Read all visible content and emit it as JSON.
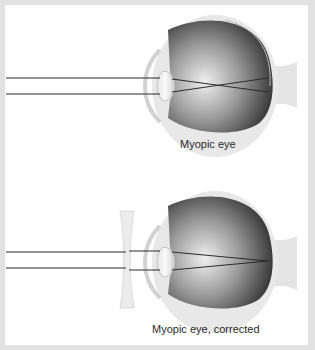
{
  "figure": {
    "panels": [
      {
        "id": "uncorrected",
        "caption": "Myopic eye",
        "corrective_lens": false,
        "focus": "in front of retina"
      },
      {
        "id": "corrected",
        "caption": "Myopic eye, corrected",
        "corrective_lens": true,
        "lens_type": "concave",
        "focus": "on retina"
      }
    ]
  },
  "colors": {
    "background_frame": "#e2e2e2",
    "panel": "#ffffff",
    "light_ray": "#2b2b2b",
    "sclera": "#e6e6e6",
    "eyeball_dark": "#1e1e1e",
    "lens": "#f4f4f4"
  }
}
